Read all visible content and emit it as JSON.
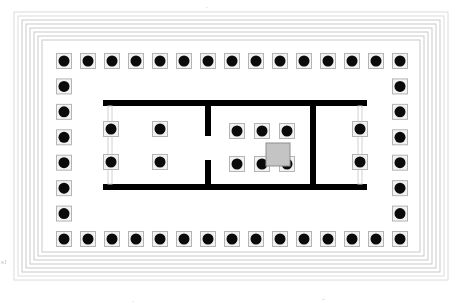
{
  "figure": {
    "orientation": "plan view"
  },
  "colors": {
    "background": "#ffffff",
    "wall_fill": "#000000",
    "column_shaft": "#0a0a0a",
    "column_base_fill": "#f2f2f2",
    "column_base_stroke": "#b5b5b5",
    "step_line": "#c9c9c9",
    "step_line_outer": "#dcdcdc",
    "statue_base_fill": "#c4c4c4",
    "statue_base_stroke": "#8f8f8f",
    "anta_pier": "#d2d2d2",
    "edge_mark": "#b9b9b9"
  },
  "crepidoma": {
    "name": "stepped platform",
    "step_count": 7,
    "outer_rect": {
      "x": 14,
      "y": 12,
      "width": 434,
      "height": 268
    },
    "step_inset": 4,
    "stroke_width": 1
  },
  "stylobate": {
    "name": "stylobate",
    "rect": {
      "x": 42,
      "y": 40,
      "width": 378,
      "height": 212
    }
  },
  "peristyle": {
    "name": "peristyle colonnade",
    "columns_on_long_side": 15,
    "columns_on_short_side": 8,
    "total_columns": 42,
    "column_diameter": 11,
    "base_size": 15,
    "top_row_y": 61,
    "bottom_row_y": 239,
    "left_col_x": 64,
    "right_col_x": 400,
    "long_side_spacing": 24,
    "short_side_spacing": 25.43
  },
  "interior_block": {
    "name": "cella block",
    "outer_rect": {
      "x": 103,
      "y": 100,
      "width": 264,
      "height": 90
    },
    "wall_thickness": 6
  },
  "chambers": [
    {
      "id": "opisthodomos",
      "label": "opisthodomos",
      "position": "west",
      "rect": {
        "x": 103,
        "y": 100,
        "width": 105,
        "height": 90
      },
      "interior_columns": 4,
      "interior_grid": "2 x 2",
      "in_antis_columns": 2,
      "in_antis_side": "west"
    },
    {
      "id": "cella",
      "label": "cella / naos",
      "position": "center",
      "rect": {
        "x": 205,
        "y": 100,
        "width": 111,
        "height": 90
      },
      "interior_columns": 6,
      "interior_grid": "3 x 2",
      "in_antis_columns": 0,
      "has_statue_base": true
    },
    {
      "id": "pronaos",
      "label": "pronaos",
      "position": "east",
      "rect": {
        "x": 313,
        "y": 100,
        "width": 54,
        "height": 90
      },
      "interior_columns": 0,
      "in_antis_columns": 2,
      "in_antis_side": "east"
    }
  ],
  "statue_base": {
    "name": "cult statue base",
    "rect": {
      "x": 266,
      "y": 143,
      "width": 24,
      "height": 23
    },
    "fill": "#c4c4c4"
  },
  "interior_column_positions": {
    "opisthodomos_free": [
      {
        "x": 160,
        "y": 129
      },
      {
        "x": 160,
        "y": 162
      },
      {
        "x": 111,
        "y": 129
      },
      {
        "x": 111,
        "y": 162
      }
    ],
    "cella_free": [
      {
        "x": 237,
        "y": 131
      },
      {
        "x": 262,
        "y": 131
      },
      {
        "x": 287,
        "y": 131
      },
      {
        "x": 237,
        "y": 164
      },
      {
        "x": 262,
        "y": 164
      },
      {
        "x": 287,
        "y": 164
      }
    ],
    "pronaos_in_antis": [
      {
        "x": 360,
        "y": 129
      },
      {
        "x": 360,
        "y": 162
      }
    ]
  },
  "cross_walls": [
    {
      "id": "wall-west-cella",
      "x": 205,
      "y": 100,
      "width": 6,
      "height": 90,
      "doorway": true,
      "doorway_y": 136,
      "doorway_height": 24
    },
    {
      "id": "wall-cella-east",
      "x": 310,
      "y": 100,
      "width": 6,
      "height": 90,
      "doorway": false
    }
  ],
  "edge_marks": {
    "left": "s\nl",
    "bottom_left": ".",
    "bottom_right": "..",
    "top": "."
  }
}
